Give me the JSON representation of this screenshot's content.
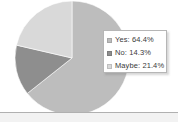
{
  "chart_data": {
    "type": "pie",
    "title": "",
    "categories": [
      "Yes",
      "No",
      "Maybe"
    ],
    "values": [
      64.4,
      14.3,
      21.4
    ],
    "value_unit": "%",
    "labels": [
      "Yes: 64.4%",
      "No: 14.3%",
      "Maybe: 21.4%"
    ],
    "colors": [
      "#bdbdbd",
      "#8e8e8e",
      "#d9d9d9"
    ],
    "start_angle_deg": 0,
    "direction": "clockwise",
    "legend_position": "right",
    "grid": false
  },
  "legend": {
    "entries": [
      {
        "label": "Yes: 64.4%",
        "color": "#bdbdbd"
      },
      {
        "label": "No: 14.3%",
        "color": "#8e8e8e"
      },
      {
        "label": "Maybe: 21.4%",
        "color": "#d9d9d9"
      }
    ]
  },
  "style": {
    "background": "#ffffff",
    "divider_color": "#b0b0b0",
    "footer_color": "#f2f2f2",
    "legend_border": "#b6b6b6",
    "text_color": "#3a3a3a"
  }
}
